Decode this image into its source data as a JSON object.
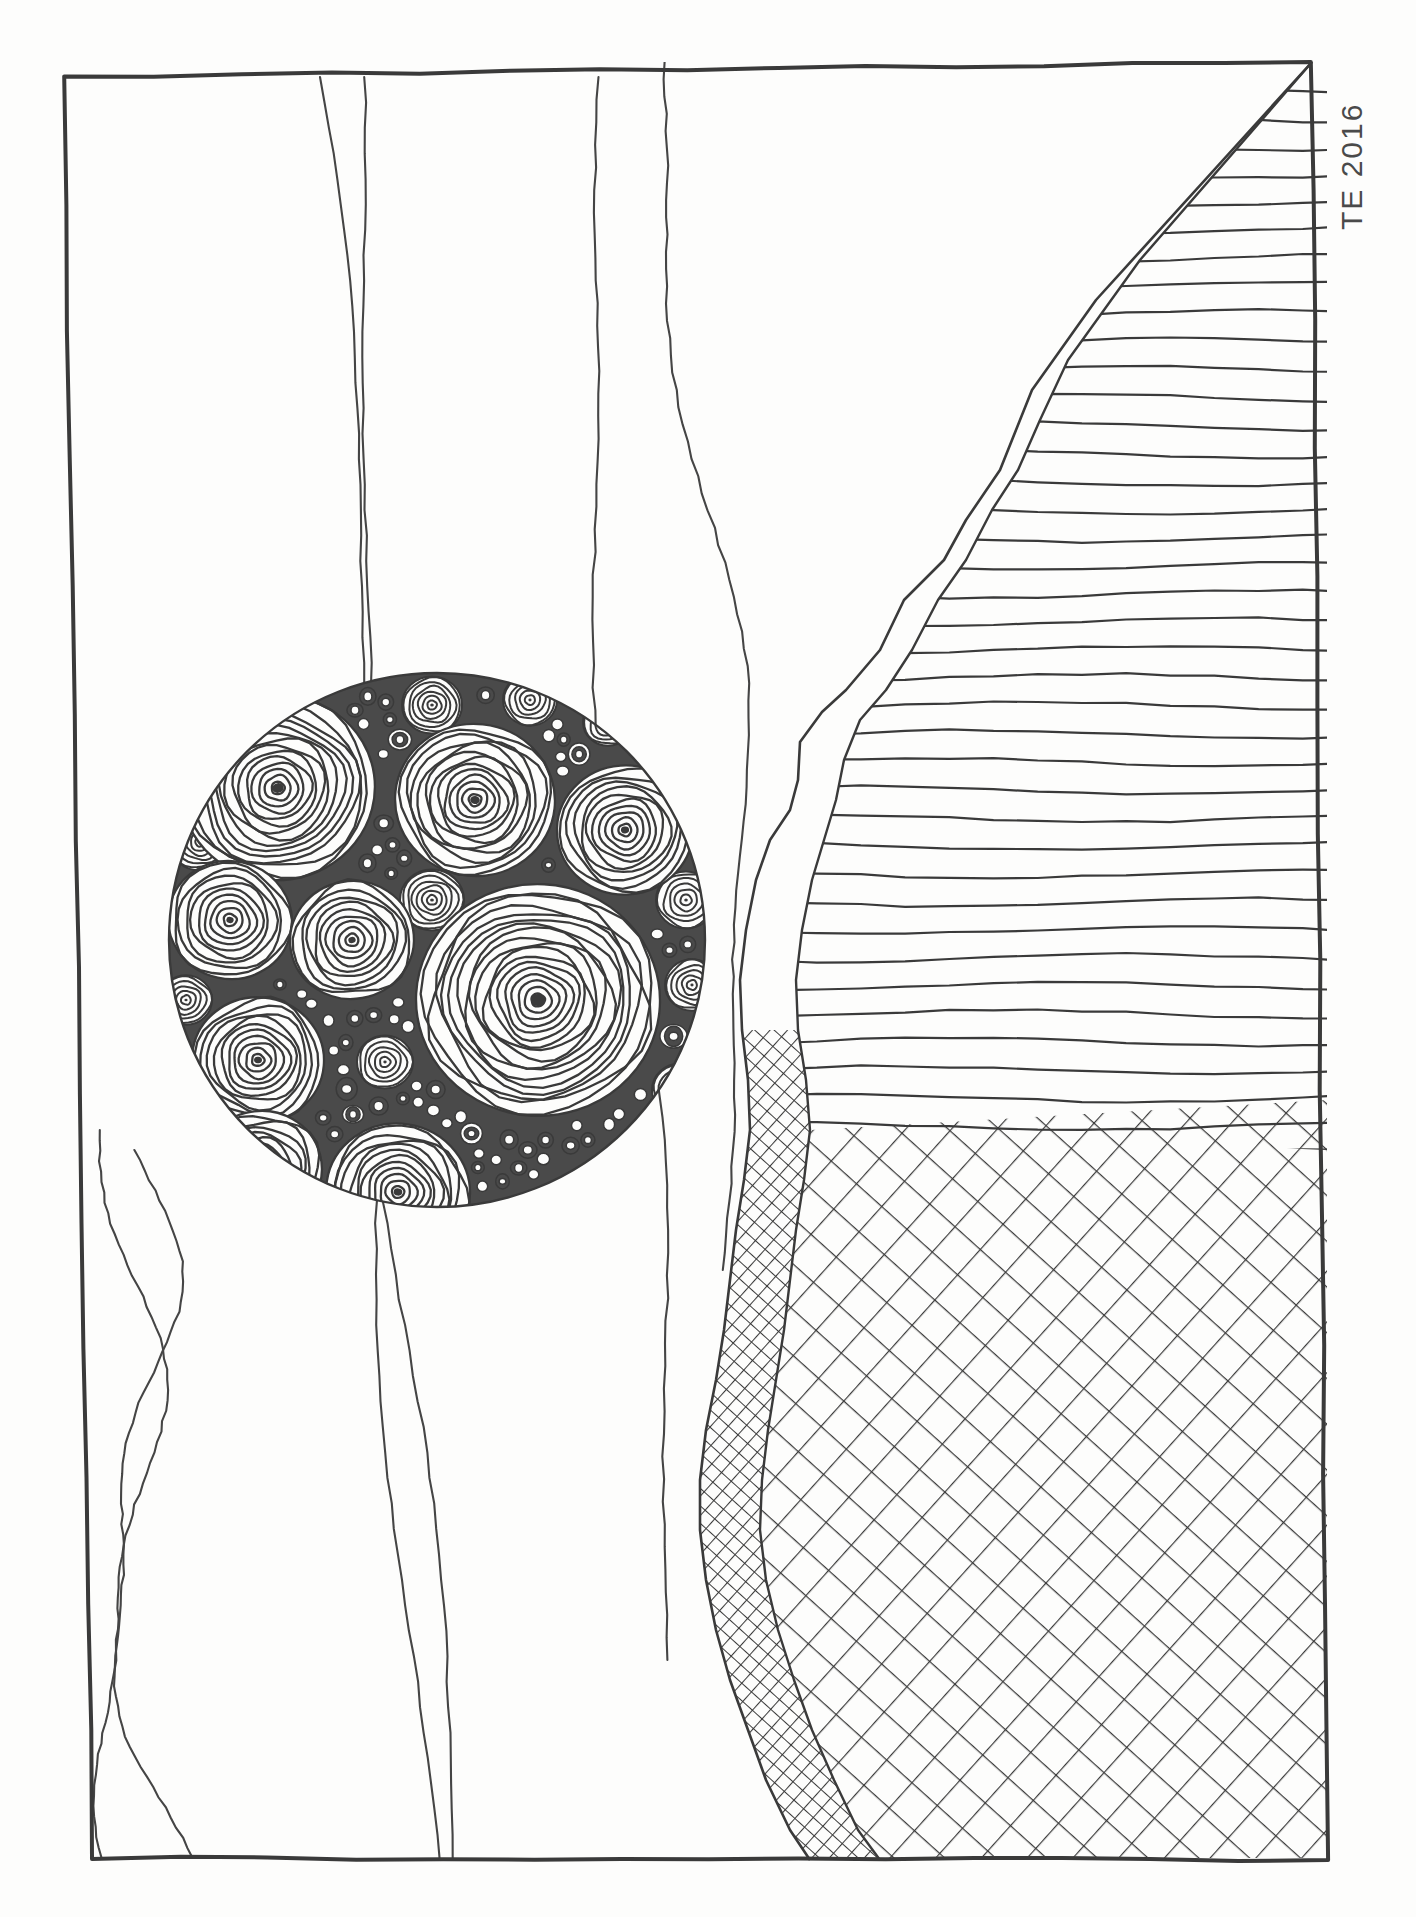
{
  "artwork": {
    "title": "Pen and Ink Landscape with Patterned Sphere",
    "medium": "ink on paper",
    "signature": "TE 2016",
    "paper_color": "#fdfdfc",
    "ink_color": "#3a3a3a",
    "canvas": {
      "width": 1416,
      "height": 1917
    }
  },
  "frame": {
    "label": "hand-drawn border",
    "top_left": [
      64,
      77
    ],
    "top_right": [
      1312,
      62
    ],
    "bottom_right": [
      1327,
      1860
    ],
    "bottom_left": [
      92,
      1858
    ],
    "stroke_width": 4
  },
  "sky_lines": {
    "label": "wavy vertical contour lines",
    "count": 6,
    "lines": [
      {
        "name": "wave-1",
        "x_top": 320,
        "x_bottom": 430,
        "y_start": 77,
        "y_end": 1860
      },
      {
        "name": "wave-2",
        "x_top": 340,
        "x_bottom": 440,
        "y_start": 77,
        "y_end": 1860
      },
      {
        "name": "wave-3",
        "x_top": 596,
        "x_bottom": 660,
        "y_start": 77,
        "y_end": 1660
      },
      {
        "name": "wave-4",
        "x_top": 680,
        "x_bottom": 745,
        "y_start": 62,
        "y_end": 1270
      },
      {
        "name": "wave-5-teardrop-outer",
        "x_top": 122,
        "x_bottom": 130,
        "y_start": 1130,
        "y_end": 1858
      },
      {
        "name": "wave-6-teardrop-inner",
        "x_top": 130,
        "x_bottom": 155,
        "y_start": 1150,
        "y_end": 1858
      }
    ]
  },
  "sphere": {
    "label": "patterned circular motif",
    "center": [
      437,
      940
    ],
    "radius_x": 268,
    "radius_y": 267,
    "large_spiral_count": 10,
    "medium_spiral_count": 14,
    "small_dot_count": 120,
    "large_spirals": [
      {
        "cx": 278,
        "cy": 788,
        "r": 97,
        "rings": 14,
        "rot": -8
      },
      {
        "cx": 475,
        "cy": 800,
        "r": 80,
        "rings": 12,
        "rot": 6
      },
      {
        "cx": 625,
        "cy": 830,
        "r": 68,
        "rings": 10,
        "rot": -4
      },
      {
        "cx": 230,
        "cy": 920,
        "r": 62,
        "rings": 9,
        "rot": 12
      },
      {
        "cx": 352,
        "cy": 940,
        "r": 62,
        "rings": 9,
        "rot": -10
      },
      {
        "cx": 538,
        "cy": 1000,
        "r": 122,
        "rings": 17,
        "rot": 3
      },
      {
        "cx": 258,
        "cy": 1060,
        "r": 66,
        "rings": 10,
        "rot": 5
      },
      {
        "cx": 260,
        "cy": 1170,
        "r": 62,
        "rings": 9,
        "rot": -14
      },
      {
        "cx": 398,
        "cy": 1192,
        "r": 72,
        "rings": 11,
        "rot": 8
      },
      {
        "cx": 542,
        "cy": 1258,
        "r": 52,
        "rings": 8,
        "rot": -6
      }
    ],
    "medium_spirals": [
      {
        "cx": 432,
        "cy": 705,
        "r": 30,
        "rings": 6
      },
      {
        "cx": 530,
        "cy": 700,
        "r": 27,
        "rings": 5
      },
      {
        "cx": 608,
        "cy": 722,
        "r": 25,
        "rings": 5
      },
      {
        "cx": 662,
        "cy": 760,
        "r": 22,
        "rings": 4
      },
      {
        "cx": 200,
        "cy": 842,
        "r": 30,
        "rings": 6
      },
      {
        "cx": 432,
        "cy": 900,
        "r": 32,
        "rings": 6
      },
      {
        "cx": 686,
        "cy": 900,
        "r": 30,
        "rings": 5
      },
      {
        "cx": 692,
        "cy": 985,
        "r": 27,
        "rings": 5
      },
      {
        "cx": 186,
        "cy": 1000,
        "r": 26,
        "rings": 5
      },
      {
        "cx": 385,
        "cy": 1062,
        "r": 28,
        "rings": 5
      },
      {
        "cx": 680,
        "cy": 1090,
        "r": 28,
        "rings": 5
      },
      {
        "cx": 652,
        "cy": 1170,
        "r": 25,
        "rings": 5
      },
      {
        "cx": 210,
        "cy": 1105,
        "r": 22,
        "rings": 4
      },
      {
        "cx": 480,
        "cy": 1268,
        "r": 22,
        "rings": 4
      }
    ]
  },
  "mountain": {
    "label": "jagged mountain ridge with hatching",
    "upper_ridge_points": "1312,62 1096,300 1032,390 1012,440 1000,470 966,520 944,560 904,600 880,650 846,690 822,712 800,742 798,780 790,810 770,840 756,880 746,930 740,980 742,1030 748,1080 750,1130 744,1180 736,1230 730,1280 724,1330 716,1380 706,1430 700,1480 700,1530 706,1580 716,1630 730,1680 748,1730 766,1780 790,1830 810,1860",
    "inner_ridge_points": "1312,62 1140,260 1068,360 1040,420 1018,470 992,510 966,560 938,600 912,650 886,690 860,720 844,760 836,800 824,840 812,880 802,930 796,980 798,1030 806,1080 810,1130 804,1180 796,1230 790,1280 784,1330 776,1380 768,1430 762,1480 760,1530 766,1580 778,1630 794,1680 812,1730 834,1780 858,1830 880,1860",
    "hatch_horizontal": {
      "label": "horizontal contour hatching",
      "count": 46,
      "spacing": 28
    },
    "hatch_cross_fine": {
      "label": "fine diagonal crosshatch",
      "spacing": 13,
      "angle": 42
    },
    "hatch_cross_coarse": {
      "label": "coarse diagonal crosshatch",
      "spacing": 34,
      "angle": 42
    }
  }
}
